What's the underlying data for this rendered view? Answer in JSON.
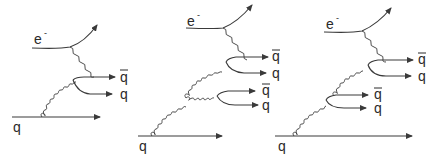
{
  "figure": {
    "line_color": "#3a3a3a",
    "background": "#ffffff"
  },
  "diagrams": [
    {
      "id": "diagram-1",
      "labels": {
        "electron": "e",
        "electron_charge": "-",
        "incoming_quark": "q",
        "pair1_antiquark": "q",
        "pair1_quark": "q"
      }
    },
    {
      "id": "diagram-2",
      "labels": {
        "electron": "e",
        "electron_charge": "-",
        "incoming_quark": "q",
        "pair1_antiquark": "q",
        "pair1_quark": "q",
        "pair2_antiquark": "q",
        "pair2_quark": "q"
      }
    },
    {
      "id": "diagram-3",
      "labels": {
        "electron": "e",
        "electron_charge": "-",
        "incoming_quark": "q",
        "pair1_antiquark": "q",
        "pair1_quark": "q",
        "pair2_antiquark": "q",
        "pair2_quark": "q"
      }
    }
  ]
}
